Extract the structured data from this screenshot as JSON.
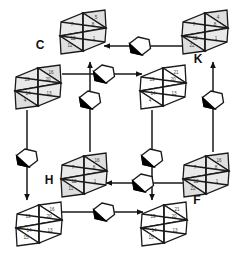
{
  "figure": {
    "background_color": "#ffffff",
    "ink_color": "#1a1a1a",
    "facet_fill_light": "#e9e9e9",
    "facet_fill_mid": "#dedede",
    "facet_fill_white": "#ffffff",
    "number_color": "#3a3a3a",
    "marker_fill": "#ffffff",
    "marker_wedge": "#000000"
  },
  "labels": [
    {
      "id": "label-c",
      "text": "C",
      "x": 40,
      "y": 46
    },
    {
      "id": "label-k",
      "text": "K",
      "x": 198,
      "y": 60
    },
    {
      "id": "label-h",
      "text": "H",
      "x": 49,
      "y": 181
    },
    {
      "id": "label-f",
      "text": "F",
      "x": 197,
      "y": 201
    }
  ],
  "nodes": [
    {
      "id": "node-c",
      "label": "C",
      "cx": 83,
      "cy": 32,
      "shaded": true,
      "facets": [
        {
          "pos": "top-right",
          "value": "5"
        },
        {
          "pos": "upper-left",
          "value": "7"
        },
        {
          "pos": "upper-right",
          "value": "8"
        },
        {
          "pos": "lower-left",
          "value": "12"
        },
        {
          "pos": "lower-right",
          "value": "1"
        },
        {
          "pos": "bottom-left",
          "value": "11"
        }
      ]
    },
    {
      "id": "node-k",
      "label": "K",
      "cx": 205,
      "cy": 32,
      "shaded": true,
      "facets": [
        {
          "pos": "top-right",
          "value": "4"
        },
        {
          "pos": "upper-left",
          "value": "7"
        },
        {
          "pos": "upper-right",
          "value": "8"
        },
        {
          "pos": "lower-left",
          "value": "12"
        },
        {
          "pos": "lower-right",
          "value": "1"
        },
        {
          "pos": "bottom-left",
          "value": "22"
        }
      ]
    },
    {
      "id": "node-left-mid",
      "label": "",
      "cx": 38,
      "cy": 87,
      "shaded": true,
      "facets": [
        {
          "pos": "top-right",
          "value": "16"
        },
        {
          "pos": "upper-left",
          "value": "19"
        },
        {
          "pos": "upper-right",
          "value": "20"
        },
        {
          "pos": "lower-left",
          "value": "14"
        },
        {
          "pos": "lower-right",
          "value": "13"
        },
        {
          "pos": "bottom-left",
          "value": "4"
        }
      ]
    },
    {
      "id": "node-right-mid",
      "label": "",
      "cx": 163,
      "cy": 87,
      "shaded": false,
      "facets": [
        {
          "pos": "top-right",
          "value": "21"
        },
        {
          "pos": "upper-left",
          "value": "19"
        },
        {
          "pos": "upper-right",
          "value": "20"
        },
        {
          "pos": "lower-left",
          "value": "14"
        },
        {
          "pos": "lower-right",
          "value": "13"
        },
        {
          "pos": "bottom-left",
          "value": "4"
        }
      ]
    },
    {
      "id": "node-h",
      "label": "H",
      "cx": 84,
      "cy": 175,
      "shaded": true,
      "facets": [
        {
          "pos": "top-right",
          "value": "16"
        },
        {
          "pos": "upper-left",
          "value": "7"
        },
        {
          "pos": "upper-right",
          "value": "8"
        },
        {
          "pos": "lower-left",
          "value": "12"
        },
        {
          "pos": "lower-right",
          "value": "1"
        },
        {
          "pos": "bottom-left",
          "value": "11"
        }
      ]
    },
    {
      "id": "node-f",
      "label": "F",
      "cx": 206,
      "cy": 175,
      "shaded": true,
      "facets": [
        {
          "pos": "top-right",
          "value": "16"
        },
        {
          "pos": "upper-left",
          "value": "7"
        },
        {
          "pos": "upper-right",
          "value": "8"
        },
        {
          "pos": "lower-left",
          "value": "12"
        },
        {
          "pos": "lower-right",
          "value": "1"
        },
        {
          "pos": "bottom-left",
          "value": "22"
        }
      ]
    },
    {
      "id": "node-bottom-left",
      "label": "",
      "cx": 39,
      "cy": 224,
      "shaded": false,
      "facets": [
        {
          "pos": "top-right",
          "value": "16"
        },
        {
          "pos": "upper-left",
          "value": "19"
        },
        {
          "pos": "upper-right",
          "value": "20"
        },
        {
          "pos": "lower-left",
          "value": "14"
        },
        {
          "pos": "lower-right",
          "value": "13"
        },
        {
          "pos": "bottom-left",
          "value": "15"
        }
      ]
    },
    {
      "id": "node-bottom-right",
      "label": "",
      "cx": 164,
      "cy": 224,
      "shaded": false,
      "facets": [
        {
          "pos": "top-right",
          "value": "21"
        },
        {
          "pos": "upper-left",
          "value": "19"
        },
        {
          "pos": "upper-right",
          "value": "20"
        },
        {
          "pos": "lower-left",
          "value": "14"
        },
        {
          "pos": "lower-right",
          "value": "13"
        },
        {
          "pos": "bottom-left",
          "value": "15"
        }
      ]
    }
  ],
  "arrows": [
    {
      "id": "arrow-k-to-c",
      "from": "node-k",
      "to": "node-c",
      "direction": "left",
      "path": "M 186 46 L 104 46",
      "marker_x": 140,
      "marker_y": 46
    },
    {
      "id": "arrow-left-to-right",
      "from": "node-left-mid",
      "to": "node-right-mid",
      "direction": "right",
      "path": "M 62 74 L 142 74",
      "marker_x": 104,
      "marker_y": 74
    },
    {
      "id": "arrow-h-to-c",
      "from": "node-h",
      "to": "node-c",
      "direction": "up",
      "path": "M 90 152 L 90 62",
      "marker_x": 90,
      "marker_y": 100
    },
    {
      "id": "arrow-k-up",
      "from": "node-f",
      "to": "node-k",
      "direction": "up",
      "path": "M 213 152 L 213 62",
      "marker_x": 213,
      "marker_y": 100
    },
    {
      "id": "arrow-left-down",
      "from": "node-left-mid",
      "to": "node-bottom-left",
      "direction": "down",
      "path": "M 27 110 L 27 200",
      "marker_x": 27,
      "marker_y": 158
    },
    {
      "id": "arrow-right-down",
      "from": "node-right-mid",
      "to": "node-bottom-right",
      "direction": "down",
      "path": "M 152 110 L 152 200",
      "marker_x": 152,
      "marker_y": 158
    },
    {
      "id": "arrow-f-to-h",
      "from": "node-f",
      "to": "node-h",
      "direction": "left",
      "path": "M 188 183 L 106 183",
      "marker_x": 143,
      "marker_y": 183
    },
    {
      "id": "arrow-bl-to-br",
      "from": "node-bottom-left",
      "to": "node-bottom-right",
      "direction": "right",
      "path": "M 62 212 L 143 212",
      "marker_x": 104,
      "marker_y": 212
    }
  ]
}
